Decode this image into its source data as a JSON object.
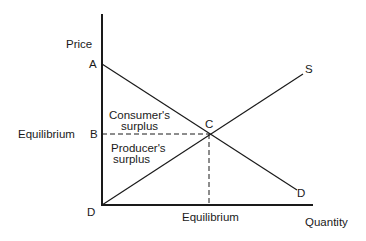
{
  "diagram": {
    "axes": {
      "y_label": "Price",
      "x_label": "Quantity"
    },
    "points": {
      "A": "A",
      "B": "B",
      "C": "C",
      "D_origin": "D",
      "D_curve": "D",
      "S_curve": "S"
    },
    "labels": {
      "price_equilibrium": "Equilibrium",
      "quantity_equilibrium": "Equilibrium",
      "consumer_surplus_line1": "Consumer's",
      "consumer_surplus_line2": "surplus",
      "producer_surplus_line1": "Producer's",
      "producer_surplus_line2": "surplus"
    },
    "colors": {
      "ink": "#1a1a1a",
      "background": "#ffffff"
    }
  }
}
